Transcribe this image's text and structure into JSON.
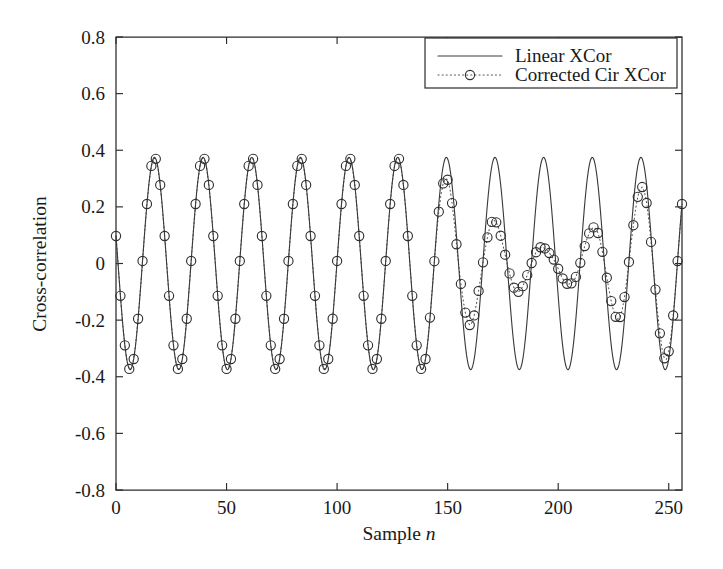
{
  "chart_data": {
    "type": "line",
    "title": "",
    "xlabel": "Sample n",
    "xlabel_plain": "Sample",
    "xlabel_italic": "n",
    "ylabel": "Cross-correlation",
    "xlim": [
      0,
      256
    ],
    "ylim": [
      -0.8,
      0.8
    ],
    "xticks": [
      0,
      50,
      100,
      150,
      200,
      250
    ],
    "xticklabels": [
      "0",
      "50",
      "100",
      "150",
      "200",
      "250"
    ],
    "yticks": [
      -0.8,
      -0.6,
      -0.4,
      -0.2,
      0,
      0.2,
      0.4,
      0.6,
      0.8
    ],
    "yticklabels": [
      "-0.8",
      "-0.6",
      "-0.4",
      "-0.2",
      "0",
      "0.2",
      "0.4",
      "0.6",
      "0.8"
    ],
    "grid": false,
    "legend_position": "upper right",
    "series": [
      {
        "name": "Linear XCor",
        "style": "solid",
        "marker": "none",
        "color": "#3a3a3a",
        "description": "Constant-amplitude sinusoid of amplitude 0.375 and period 22 samples spanning the full record.",
        "amplitude": 0.375,
        "period": 22.0,
        "phase_deg": 75
      },
      {
        "name": "Corrected Cir XCor",
        "style": "dotted",
        "marker": "circle",
        "color": "#2e2e2e",
        "description": "Same sinusoid but amplitude-modulated by a V-shaped envelope: tracks the solid curve up to n=145, collapses to about 0.05 near n=196, then recovers to 0.375 at n=256.",
        "period": 22.0,
        "phase_deg": 75,
        "envelope_breakpoints": [
          {
            "n": 0,
            "amplitude": 0.375
          },
          {
            "n": 140,
            "amplitude": 0.375
          },
          {
            "n": 150,
            "amplitude": 0.3
          },
          {
            "n": 158,
            "amplitude": 0.225
          },
          {
            "n": 168,
            "amplitude": 0.165
          },
          {
            "n": 178,
            "amplitude": 0.115
          },
          {
            "n": 188,
            "amplitude": 0.075
          },
          {
            "n": 196,
            "amplitude": 0.05
          },
          {
            "n": 204,
            "amplitude": 0.072
          },
          {
            "n": 212,
            "amplitude": 0.11
          },
          {
            "n": 222,
            "amplitude": 0.165
          },
          {
            "n": 232,
            "amplitude": 0.235
          },
          {
            "n": 242,
            "amplitude": 0.295
          },
          {
            "n": 250,
            "amplitude": 0.345
          },
          {
            "n": 256,
            "amplitude": 0.375
          }
        ],
        "marker_stride": 2
      }
    ],
    "annotations": []
  },
  "legend": {
    "entries": [
      {
        "label": "Linear XCor",
        "sample": "solid-line"
      },
      {
        "label": "Corrected Cir XCor",
        "sample": "dotted-circle"
      }
    ]
  },
  "colors": {
    "axis": "#2b2b2b",
    "linear_series": "#3a3a3a",
    "corrected_series": "#2e2e2e",
    "background": "#ffffff"
  }
}
